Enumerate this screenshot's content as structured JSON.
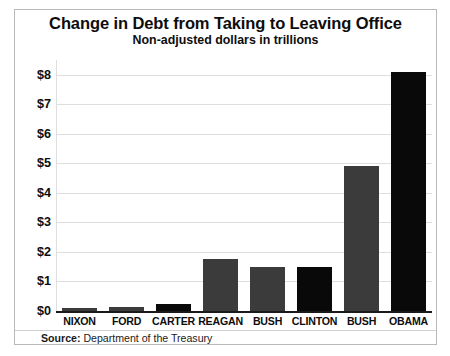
{
  "chart_data": {
    "type": "bar",
    "title": "Change in Debt from Taking to Leaving Office",
    "subtitle": "Non-adjusted dollars in trillions",
    "xlabel": "",
    "ylabel": "",
    "ylim": [
      0,
      8.5
    ],
    "grid": true,
    "legend": "none",
    "categories": [
      "NIXON",
      "FORD",
      "CARTER",
      "REAGAN",
      "BUSH",
      "CLINTON",
      "BUSH",
      "OBAMA"
    ],
    "values": [
      0.1,
      0.15,
      0.25,
      1.75,
      1.5,
      1.5,
      4.9,
      8.1
    ],
    "yticks": [
      "$0",
      "$1",
      "$2",
      "$3",
      "$4",
      "$5",
      "$6",
      "$7",
      "$8"
    ],
    "ytick_values": [
      0,
      1,
      2,
      3,
      4,
      5,
      6,
      7,
      8
    ],
    "bar_colors": [
      "#3b3b3b",
      "#3b3b3b",
      "#090909",
      "#3b3b3b",
      "#3b3b3b",
      "#090909",
      "#3b3b3b",
      "#090909"
    ],
    "source_label": "Source:",
    "source_text": " Department of the Treasury"
  }
}
